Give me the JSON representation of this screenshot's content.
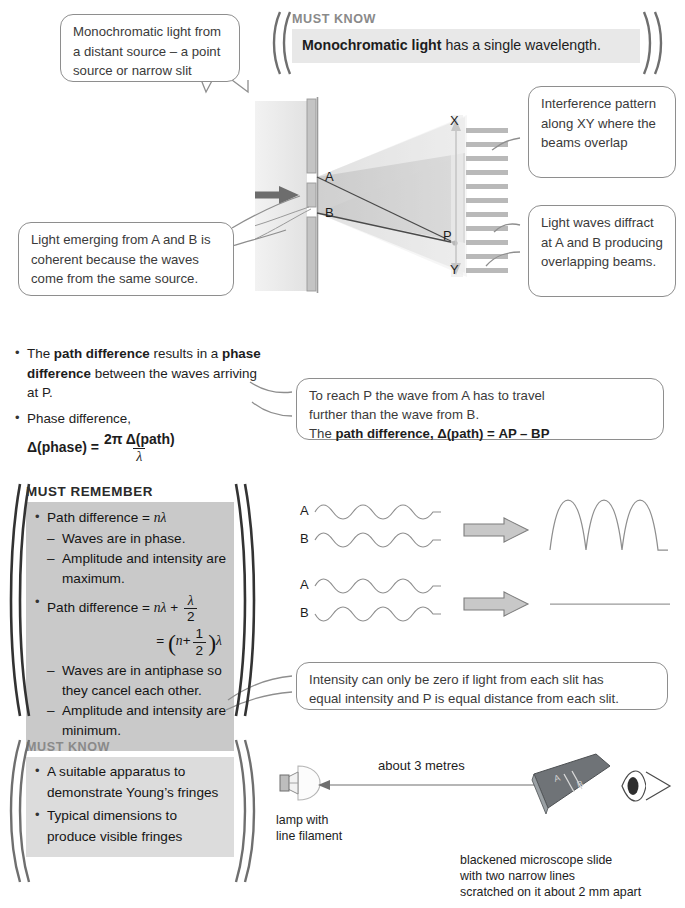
{
  "page": {
    "width": 685,
    "height": 908,
    "accent_grey": "#8a8a8a",
    "band_light": "#e8e8e8",
    "band_mid": "#dcdcdc",
    "band_grey": "#c9c9c9",
    "callout_border": "#8e8e8e"
  },
  "must_know_top": {
    "heading": "MUST KNOW",
    "statement_bold": "Monochromatic light",
    "statement_rest": " has a single wavelength."
  },
  "callouts": {
    "source": "Monochromatic light from a distant source – a point source or narrow slit",
    "interference": "Interference pattern along XY where the beams overlap",
    "coherent": "Light emerging from A and B is coherent because the waves come from the same source.",
    "diffract": "Light waves diffract at A and B producing overlapping beams.",
    "path_diff_line1": "To reach P the wave from A has to travel",
    "path_diff_line2": "further than the wave from B.",
    "path_diff_line3_pre": "The ",
    "path_diff_line3_bold": "path difference",
    "path_diff_line3_post": ", Δ(path) = AP – BP",
    "intensity_line1": "Intensity can only be zero if light from each slit has",
    "intensity_line2": "equal intensity and P is equal distance from each slit."
  },
  "diagram_top": {
    "label_a": "A",
    "label_b": "B",
    "label_x": "X",
    "label_y": "Y",
    "label_p": "P",
    "fringe_count": 11
  },
  "path_phase_block": {
    "bullet1_pre": "The ",
    "bullet1_b1": "path difference",
    "bullet1_mid": " results in a ",
    "bullet1_b2": "phase difference",
    "bullet1_post": " between the waves arriving at P.",
    "bullet2": "Phase difference,",
    "formula_lhs": "Δ(phase) =",
    "formula_num": "2π Δ(path)",
    "formula_den": "λ"
  },
  "must_remember": {
    "heading": "MUST REMEMBER",
    "item1_label": "Path difference = ",
    "item1_value": "nλ",
    "item1_subs": [
      "Waves are in phase.",
      "Amplitude and intensity are maximum."
    ],
    "item2_label": "Path difference = ",
    "item2_value_a": "nλ",
    "item2_plus": " + ",
    "item2_frac_num": "λ",
    "item2_frac_den": "2",
    "item2_eq": "=",
    "item2_line2_n": "n",
    "item2_line2_plus": "+",
    "item2_line2_num": "1",
    "item2_line2_den": "2",
    "item2_line2_lambda": "λ",
    "item2_subs": [
      "Waves are in antiphase so they cancel each other.",
      "Amplitude and intensity are minimum."
    ]
  },
  "wave_diagrams": {
    "row1_label_a": "A",
    "row1_label_b": "B",
    "row2_label_a": "A",
    "row2_label_b": "B"
  },
  "must_know_bottom": {
    "heading": "MUST KNOW",
    "items": [
      "A suitable apparatus to demonstrate Young’s fringes",
      "Typical dimensions to produce visible fringes"
    ]
  },
  "apparatus": {
    "distance_label": "about 3 metres",
    "lamp_caption_line1": "lamp with",
    "lamp_caption_line2": "line filament",
    "slide_label_a": "A",
    "slide_label_b": "B",
    "slide_caption_line1": "blackened microscope slide",
    "slide_caption_line2": "with two narrow lines",
    "slide_caption_line3": "scratched on it about 2 mm apart"
  }
}
